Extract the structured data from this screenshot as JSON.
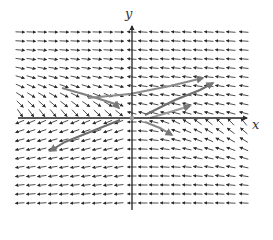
{
  "chart_data": {
    "type": "vector_field",
    "title": "",
    "xlabel": "x",
    "ylabel": "y",
    "origin_px": [
      132,
      118
    ],
    "grid": {
      "cols_x_px": [
        20,
        31,
        42,
        53,
        64,
        75,
        86,
        97,
        108,
        119,
        132,
        143,
        154,
        165,
        176,
        187,
        198,
        209,
        220,
        231,
        244
      ],
      "rows_y_px": [
        32,
        41,
        50,
        59,
        68,
        77,
        86,
        95,
        104,
        113,
        122,
        131,
        140,
        149,
        158,
        167,
        176,
        185,
        194,
        203
      ]
    },
    "field_description": {
      "upper_left": "arrows point right (toward y-axis), bending downward-right near x-axis",
      "upper_right": "arrows point left (toward y-axis), slight upward tilt",
      "lower_left": "arrows point left and down-left",
      "lower_right": "arrows point left; near x-axis point up-left toward axis"
    },
    "trajectories": [
      {
        "name": "upper-left curve",
        "points": [
          [
            62,
            88
          ],
          [
            90,
            96
          ],
          [
            115,
            104
          ],
          [
            119,
            108
          ]
        ],
        "color": "#808080"
      },
      {
        "name": "upper curve right",
        "points": [
          [
            88,
            98
          ],
          [
            130,
            94
          ],
          [
            170,
            86
          ],
          [
            203,
            78
          ]
        ],
        "color": "#8a8a8a"
      },
      {
        "name": "long diagonal upper-right",
        "points": [
          [
            145,
            115
          ],
          [
            175,
            100
          ],
          [
            200,
            90
          ],
          [
            213,
            83
          ]
        ],
        "color": "#6e6e6e"
      },
      {
        "name": "long diagonal lower-left",
        "points": [
          [
            120,
            120
          ],
          [
            90,
            132
          ],
          [
            65,
            142
          ],
          [
            50,
            151
          ]
        ],
        "color": "#6e6e6e"
      },
      {
        "name": "lower-right fan",
        "points": [
          [
            145,
            122
          ],
          [
            160,
            128
          ],
          [
            172,
            135
          ]
        ],
        "color": "#8a8a8a"
      },
      {
        "name": "short right",
        "points": [
          [
            150,
            118
          ],
          [
            170,
            112
          ],
          [
            190,
            106
          ]
        ],
        "color": "#9a9a9a"
      }
    ],
    "axis_color": "#222222",
    "arrow_color": "#3a3a3a",
    "origin_marker_color": "#999999"
  }
}
